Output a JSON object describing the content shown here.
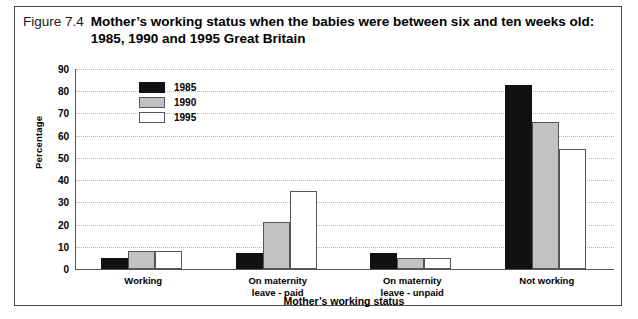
{
  "figure": {
    "number": "Figure 7.4",
    "title_line_1": "Mother’s working status when the babies were between six and ten weeks old:",
    "title_line_2": "1985, 1990 and 1995 Great Britain"
  },
  "chart_data": {
    "type": "bar",
    "title": "Mother’s working status when the babies were between six and ten weeks old: 1985, 1990 and 1995 Great Britain",
    "xlabel": "Mother’s working status",
    "ylabel": "Percentage",
    "ylim": [
      0,
      90
    ],
    "ytick_labels": [
      "0",
      "10",
      "20",
      "30",
      "40",
      "50",
      "60",
      "70",
      "80",
      "90"
    ],
    "ytick_values": [
      0,
      10,
      20,
      30,
      40,
      50,
      60,
      70,
      80,
      90
    ],
    "grid": true,
    "legend_position": "upper-left-inside",
    "categories": [
      "Working",
      "On maternity leave - paid",
      "On maternity leave - unpaid",
      "Not working"
    ],
    "category_label_lines": [
      [
        "Working"
      ],
      [
        "On maternity",
        "leave - paid"
      ],
      [
        "On maternity",
        "leave - unpaid"
      ],
      [
        "Not working"
      ]
    ],
    "series": [
      {
        "name": "1985",
        "color": "#111111",
        "values": [
          5,
          7,
          7,
          83
        ]
      },
      {
        "name": "1990",
        "color": "#C2C2C2",
        "values": [
          8,
          21,
          5,
          66
        ]
      },
      {
        "name": "1995",
        "color": "#FFFFFF",
        "values": [
          8,
          35,
          5,
          54
        ]
      }
    ]
  }
}
